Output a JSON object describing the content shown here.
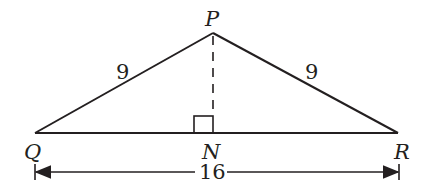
{
  "diagram": {
    "type": "isosceles-triangle",
    "colors": {
      "stroke": "#231f20",
      "background": "#ffffff"
    },
    "vertices": {
      "P": {
        "label": "P",
        "x": 213,
        "y": 33
      },
      "Q": {
        "label": "Q",
        "x": 35,
        "y": 133
      },
      "R": {
        "label": "R",
        "x": 398,
        "y": 133
      },
      "N": {
        "label": "N",
        "x": 213,
        "y": 133
      }
    },
    "sides": {
      "PQ": {
        "label": "9"
      },
      "PR": {
        "label": "9"
      },
      "QR": {
        "label": "16"
      }
    },
    "altitude": {
      "from": "P",
      "to": "N",
      "style": "dashed",
      "right_angle_at": "N"
    }
  }
}
